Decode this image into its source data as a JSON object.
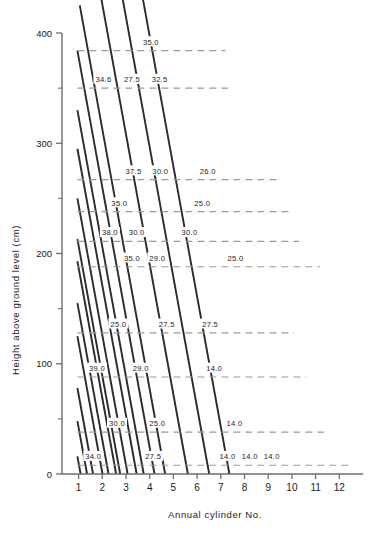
{
  "chart_data": {
    "type": "line",
    "title": "",
    "xlabel": "Annual cylinder No.",
    "ylabel": "Height above ground level (cm)",
    "xlim": [
      0.3,
      13.0
    ],
    "ylim": [
      0,
      400
    ],
    "grid": false,
    "legend": "none",
    "x_ticks": [
      "1",
      "2",
      "3",
      "4",
      "5",
      "6",
      "7",
      "8",
      "9",
      "10",
      "11",
      "12"
    ],
    "y_ticks": [
      "0",
      "100",
      "200",
      "300",
      "400"
    ],
    "y_minor_ticks": [
      50,
      150,
      250,
      350
    ],
    "diagonals": [
      {
        "x_top": 1.05,
        "y_top": 425
      },
      {
        "x_top": 1.95,
        "y_top": 432
      },
      {
        "x_top": 2.85,
        "y_top": 432
      },
      {
        "x_top": 3.72,
        "y_top": 430
      },
      {
        "x_top": 0.95,
        "y_top": 384
      },
      {
        "x_top": 0.95,
        "y_top": 330
      },
      {
        "x_top": 0.95,
        "y_top": 295
      },
      {
        "x_top": 0.95,
        "y_top": 250
      },
      {
        "x_top": 0.95,
        "y_top": 213
      },
      {
        "x_top": 0.95,
        "y_top": 193
      },
      {
        "x_top": 0.95,
        "y_top": 155
      },
      {
        "x_top": 0.95,
        "y_top": 125
      },
      {
        "x_top": 0.95,
        "y_top": 78
      },
      {
        "x_top": 0.95,
        "y_top": 48
      },
      {
        "x_top": 0.95,
        "y_top": 16
      }
    ],
    "dashed_levels": [
      {
        "height": 384,
        "x_start": 0.95,
        "x_end": 7.2
      },
      {
        "height": 350,
        "x_start": 0.95,
        "x_end": 7.4
      },
      {
        "height": 267,
        "x_start": 0.95,
        "x_end": 9.4
      },
      {
        "height": 238,
        "x_start": 0.95,
        "x_end": 10.0
      },
      {
        "height": 211,
        "x_start": 0.95,
        "x_end": 10.3
      },
      {
        "height": 188,
        "x_start": 0.95,
        "x_end": 11.2
      },
      {
        "height": 128,
        "x_start": 0.95,
        "x_end": 10.1
      },
      {
        "height": 88,
        "x_start": 0.95,
        "x_end": 10.6
      },
      {
        "height": 38,
        "x_start": 0.95,
        "x_end": 11.4
      },
      {
        "height": 8,
        "x_start": 0.95,
        "x_end": 12.5
      }
    ],
    "value_labels": [
      {
        "text": "35.0",
        "x": 4.05,
        "y": 392
      },
      {
        "text": "34.6",
        "x": 2.05,
        "y": 358
      },
      {
        "text": "27.5",
        "x": 3.25,
        "y": 358
      },
      {
        "text": "32.5",
        "x": 4.42,
        "y": 358
      },
      {
        "text": "37.5",
        "x": 3.32,
        "y": 275
      },
      {
        "text": "30.0",
        "x": 4.45,
        "y": 275
      },
      {
        "text": "26.0",
        "x": 6.45,
        "y": 275
      },
      {
        "text": "35.0",
        "x": 2.72,
        "y": 246
      },
      {
        "text": "25.0",
        "x": 6.22,
        "y": 246
      },
      {
        "text": "38.0",
        "x": 2.32,
        "y": 219
      },
      {
        "text": "30.0",
        "x": 3.45,
        "y": 219
      },
      {
        "text": "30.0",
        "x": 5.68,
        "y": 219
      },
      {
        "text": "35.0",
        "x": 3.25,
        "y": 196
      },
      {
        "text": "29.0",
        "x": 4.32,
        "y": 196
      },
      {
        "text": "25.0",
        "x": 7.62,
        "y": 196
      },
      {
        "text": "25.0",
        "x": 2.68,
        "y": 136
      },
      {
        "text": "27.5",
        "x": 4.72,
        "y": 136
      },
      {
        "text": "27.5",
        "x": 6.55,
        "y": 136
      },
      {
        "text": "39.0",
        "x": 1.78,
        "y": 96
      },
      {
        "text": "29.0",
        "x": 3.62,
        "y": 96
      },
      {
        "text": "14.0",
        "x": 6.72,
        "y": 96
      },
      {
        "text": "30.0",
        "x": 2.62,
        "y": 46
      },
      {
        "text": "25.0",
        "x": 4.32,
        "y": 46
      },
      {
        "text": "14.0",
        "x": 7.58,
        "y": 46
      },
      {
        "text": "34.0",
        "x": 1.62,
        "y": 16
      },
      {
        "text": "27.5",
        "x": 4.15,
        "y": 16
      },
      {
        "text": "14.0",
        "x": 7.28,
        "y": 16
      },
      {
        "text": "14.0",
        "x": 8.22,
        "y": 16
      },
      {
        "text": "14.0",
        "x": 9.15,
        "y": 16
      }
    ]
  },
  "colors": {
    "background": "#ffffff",
    "axis": "#6e6e6e",
    "diagonal": "#2b2b2b",
    "dashed": "#9a9a9a",
    "text": "#1a1a1a"
  }
}
